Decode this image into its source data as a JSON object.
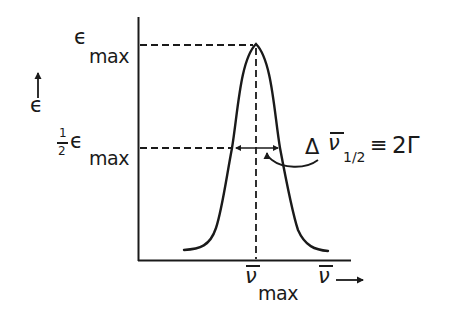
{
  "diagram": {
    "type": "absorption band profile",
    "y_axis": {
      "label": "ϵ",
      "arrow": "up",
      "ticks": [
        {
          "symbol": "ϵ",
          "subscript": "max",
          "level": "peak"
        },
        {
          "prefix_num": "1",
          "prefix_den": "2",
          "symbol": "ϵ",
          "subscript": "max",
          "level": "half"
        }
      ]
    },
    "x_axis": {
      "label": "ν",
      "label_overbar": true,
      "arrow": "right",
      "ticks": [
        {
          "symbol": "ν",
          "overbar": true,
          "subscript": "max"
        }
      ]
    },
    "annotation": {
      "delta": "Δ",
      "symbol": "ν",
      "overbar": true,
      "subscript": "1/2",
      "relation": "≡",
      "value": "2Γ"
    },
    "curve": {
      "shape": "bell",
      "peak_label": "ϵmax",
      "half_width_label": "Δν̄1/2 ≡ 2Γ"
    },
    "colors": {
      "ink": "#1a1a1a",
      "background": "#ffffff"
    }
  }
}
